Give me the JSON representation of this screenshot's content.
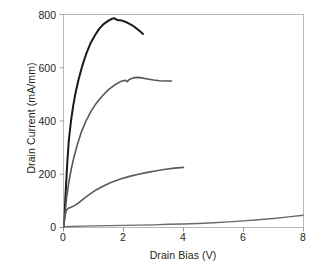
{
  "chart_data": {
    "type": "line",
    "title": "",
    "subtitle": "",
    "xlabel": "Drain Bias (V)",
    "ylabel": "Drain Current (mA/mm)",
    "xlim": [
      0,
      8
    ],
    "ylim": [
      0,
      800
    ],
    "xticks": [
      0,
      2,
      4,
      6,
      8
    ],
    "yticks": [
      0,
      200,
      400,
      600,
      800
    ],
    "xtick_labels": [
      "0",
      "2",
      "4",
      "6",
      "8"
    ],
    "ytick_labels": [
      "0",
      "200",
      "400",
      "600",
      "800"
    ],
    "grid": false,
    "legend": null,
    "annotations": [],
    "series": [
      {
        "name": "curve-1-top",
        "color": "#1a1a1a",
        "width": 2.0,
        "points": [
          [
            0.0,
            0
          ],
          [
            0.04,
            60
          ],
          [
            0.08,
            150
          ],
          [
            0.13,
            250
          ],
          [
            0.18,
            330
          ],
          [
            0.25,
            400
          ],
          [
            0.32,
            455
          ],
          [
            0.4,
            505
          ],
          [
            0.5,
            555
          ],
          [
            0.62,
            605
          ],
          [
            0.75,
            650
          ],
          [
            0.9,
            692
          ],
          [
            1.05,
            722
          ],
          [
            1.2,
            748
          ],
          [
            1.35,
            765
          ],
          [
            1.5,
            777
          ],
          [
            1.62,
            784
          ],
          [
            1.7,
            786
          ],
          [
            1.78,
            780
          ],
          [
            1.85,
            778
          ],
          [
            1.95,
            777
          ],
          [
            2.05,
            773
          ],
          [
            2.15,
            768
          ],
          [
            2.25,
            762
          ],
          [
            2.35,
            755
          ],
          [
            2.45,
            746
          ],
          [
            2.55,
            737
          ],
          [
            2.65,
            727
          ]
        ]
      },
      {
        "name": "curve-2",
        "color": "#555555",
        "width": 1.6,
        "points": [
          [
            0.0,
            0
          ],
          [
            0.05,
            55
          ],
          [
            0.1,
            110
          ],
          [
            0.17,
            165
          ],
          [
            0.25,
            215
          ],
          [
            0.35,
            265
          ],
          [
            0.47,
            315
          ],
          [
            0.6,
            360
          ],
          [
            0.75,
            400
          ],
          [
            0.92,
            437
          ],
          [
            1.1,
            468
          ],
          [
            1.3,
            495
          ],
          [
            1.5,
            518
          ],
          [
            1.7,
            535
          ],
          [
            1.9,
            548
          ],
          [
            2.05,
            553
          ],
          [
            2.12,
            548
          ],
          [
            2.2,
            556
          ],
          [
            2.32,
            562
          ],
          [
            2.45,
            564
          ],
          [
            2.6,
            562
          ],
          [
            2.8,
            558
          ],
          [
            3.0,
            554
          ],
          [
            3.2,
            551
          ],
          [
            3.4,
            550
          ],
          [
            3.6,
            550
          ]
        ]
      },
      {
        "name": "curve-3",
        "color": "#5a5a5a",
        "width": 1.6,
        "points": [
          [
            0.0,
            0
          ],
          [
            0.03,
            25
          ],
          [
            0.06,
            50
          ],
          [
            0.1,
            66
          ],
          [
            0.16,
            72
          ],
          [
            0.25,
            76
          ],
          [
            0.38,
            83
          ],
          [
            0.52,
            94
          ],
          [
            0.7,
            110
          ],
          [
            0.9,
            127
          ],
          [
            1.1,
            142
          ],
          [
            1.35,
            157
          ],
          [
            1.6,
            170
          ],
          [
            1.9,
            182
          ],
          [
            2.2,
            192
          ],
          [
            2.5,
            200
          ],
          [
            2.8,
            207
          ],
          [
            3.1,
            213
          ],
          [
            3.4,
            219
          ],
          [
            3.7,
            223
          ],
          [
            4.0,
            226
          ]
        ]
      },
      {
        "name": "curve-4-bottom",
        "color": "#6a6a6a",
        "width": 1.4,
        "points": [
          [
            0.0,
            0
          ],
          [
            0.1,
            3
          ],
          [
            0.3,
            4
          ],
          [
            0.6,
            5
          ],
          [
            1.0,
            6
          ],
          [
            1.5,
            7
          ],
          [
            2.0,
            8
          ],
          [
            2.5,
            9
          ],
          [
            3.0,
            10
          ],
          [
            3.5,
            12
          ],
          [
            4.0,
            13
          ],
          [
            4.5,
            15
          ],
          [
            5.0,
            18
          ],
          [
            5.5,
            21
          ],
          [
            6.0,
            25
          ],
          [
            6.5,
            29
          ],
          [
            7.0,
            34
          ],
          [
            7.5,
            40
          ],
          [
            8.0,
            46
          ]
        ]
      }
    ]
  },
  "axes": {
    "frame_color": "#b7b7b7",
    "tick_color": "#9a9a9a",
    "text_color": "#231f20",
    "background": "#ffffff"
  }
}
